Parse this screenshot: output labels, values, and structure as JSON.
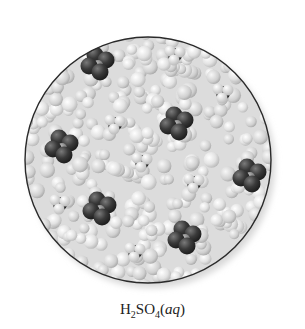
{
  "figure": {
    "caption": {
      "formula_parts": [
        "H",
        "2",
        "SO",
        "4"
      ],
      "state": "aq"
    },
    "circle": {
      "cx": 148,
      "cy": 160,
      "r": 123,
      "stroke": "#2a2a2a"
    },
    "colors": {
      "water_light": "#e9e9e9",
      "water_mid": "#cfcfcf",
      "oxygen_dark": "#3a3a3a",
      "sulfur_mid": "#8a8a8a",
      "hydrogen_light": "#f2f2f2"
    },
    "ions": [
      {
        "type": "sulfate",
        "x": 98,
        "y": 62
      },
      {
        "type": "hydronium",
        "x": 175,
        "y": 55
      },
      {
        "type": "hydronium",
        "x": 223,
        "y": 93
      },
      {
        "type": "hydronium",
        "x": 115,
        "y": 124
      },
      {
        "type": "sulfate",
        "x": 177,
        "y": 122
      },
      {
        "type": "sulfate",
        "x": 62,
        "y": 145
      },
      {
        "type": "hydronium",
        "x": 142,
        "y": 162
      },
      {
        "type": "sulfate",
        "x": 250,
        "y": 174
      },
      {
        "type": "hydronium",
        "x": 194,
        "y": 183
      },
      {
        "type": "hydronium",
        "x": 60,
        "y": 204
      },
      {
        "type": "sulfate",
        "x": 100,
        "y": 207
      },
      {
        "type": "sulfate",
        "x": 185,
        "y": 236
      },
      {
        "type": "hydronium",
        "x": 135,
        "y": 252
      }
    ]
  }
}
